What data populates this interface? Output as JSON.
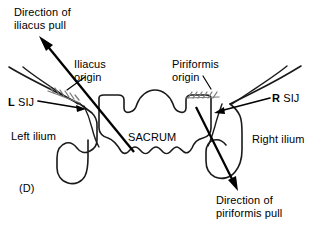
{
  "figure": {
    "panel_letter": "(D)",
    "domain_subject": "posterior pelvis: sacrum and ilia with muscle pull vectors",
    "background_color": "#ffffff",
    "line_color": "#1a1a1a",
    "hatch_color": "#7a7a7a",
    "width_px": 311,
    "height_px": 236
  },
  "labels": {
    "direction_iliacus_pull": "Direction of\niliacus pull",
    "iliacus_origin": "Iliacus\norigin",
    "piriformis_origin": "Piriformis\norigin",
    "l_sij_side": "L",
    "l_sij_text": " SIJ",
    "r_sij_side": "R",
    "r_sij_text": " SIJ",
    "left_ilium": "Left ilium",
    "right_ilium": "Right ilium",
    "sacrum": "SACRUM",
    "direction_piriformis_pull": "Direction of\npiriformis pull"
  },
  "annotations": {
    "arrows": [
      {
        "name": "iliacus-pull-arrow",
        "label": "Direction of iliacus pull",
        "from_px": [
          134,
          152
        ],
        "to_px": [
          40,
          37
        ],
        "direction": "superior-lateral (up and to the left)"
      },
      {
        "name": "piriformis-pull-arrow",
        "label": "Direction of piriformis pull",
        "from_px": [
          196,
          107
        ],
        "to_px": [
          238,
          190
        ],
        "direction": "inferior-lateral (down and to the right)"
      }
    ],
    "leader_lines": [
      {
        "name": "iliacus-origin-leader",
        "from_px": [
          84,
          76
        ],
        "to_px": [
          66,
          91
        ]
      },
      {
        "name": "piriformis-origin-leader",
        "from_px": [
          206,
          76
        ],
        "to_px": [
          212,
          88
        ]
      },
      {
        "name": "l-sij-leader",
        "from_px": [
          38,
          101
        ],
        "to_px": [
          82,
          108
        ]
      },
      {
        "name": "r-sij-leader",
        "from_px": [
          270,
          98
        ],
        "to_px": [
          216,
          112
        ]
      }
    ],
    "origin_patches": [
      {
        "name": "iliacus-origin-hatch",
        "center_px": [
          62,
          90
        ],
        "style": "stippled hatch band"
      },
      {
        "name": "piriformis-origin-hatch",
        "center_px": [
          204,
          96
        ],
        "style": "stippled hatch band"
      }
    ]
  }
}
